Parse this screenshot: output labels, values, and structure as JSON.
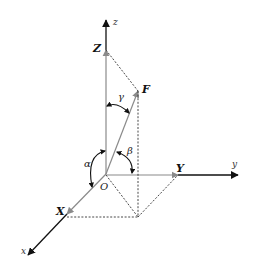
{
  "diagram": {
    "colors": {
      "axis": "#111111",
      "component": "#8a8a8a",
      "dashed": "#333333",
      "angle_arc": "#111111"
    },
    "points": {
      "origin": [
        106,
        174
      ],
      "z_tip": [
        106,
        20
      ],
      "y_tip": [
        238,
        175
      ],
      "x_tip": [
        28,
        255
      ],
      "Z": [
        106,
        50
      ],
      "F": [
        138,
        91
      ],
      "Y": [
        178,
        175
      ],
      "X": [
        67,
        214
      ],
      "F_foot": [
        138,
        217
      ]
    },
    "labels": {
      "origin": "O",
      "z_axis": "z",
      "y_axis": "y",
      "x_axis": "x",
      "Z_component": "Z",
      "Y_component": "Y",
      "X_component": "X",
      "force": "F",
      "alpha": "α",
      "beta": "β",
      "gamma": "γ"
    }
  }
}
